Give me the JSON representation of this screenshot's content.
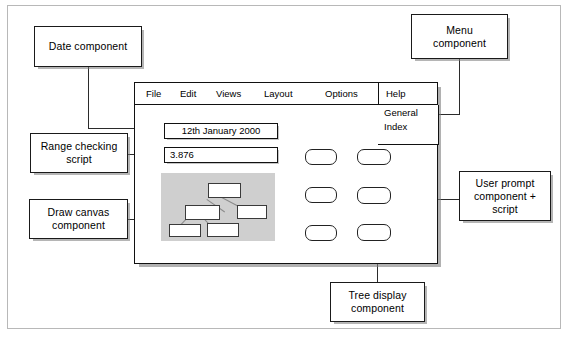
{
  "app": {
    "menubar": {
      "items": [
        {
          "label": "File"
        },
        {
          "label": "Edit"
        },
        {
          "label": "Views"
        },
        {
          "label": "Layout"
        },
        {
          "label": "Options"
        },
        {
          "label": "Help"
        }
      ]
    },
    "help_menu": {
      "items": [
        {
          "label": "General"
        },
        {
          "label": "Index"
        }
      ]
    },
    "fields": {
      "date_value": "12th January 2000",
      "range_value": "3.876"
    },
    "canvas": {
      "label": "draw-canvas"
    },
    "prompt_buttons": [
      {
        "label": ""
      },
      {
        "label": ""
      },
      {
        "label": ""
      },
      {
        "label": ""
      },
      {
        "label": ""
      },
      {
        "label": ""
      }
    ]
  },
  "annotations": {
    "date": "Date component",
    "menu": "Menu\ncomponent",
    "range": "Range checking\nscript",
    "draw": "Draw canvas\ncomponent",
    "user_prompt": "User prompt\ncomponent +\nscript",
    "tree": "Tree display\ncomponent"
  },
  "colors": {
    "ink": "#111111",
    "canvas_fill": "#cfcfcf",
    "shadow": "#8a8a8a",
    "frame": "#b8b8b8"
  }
}
